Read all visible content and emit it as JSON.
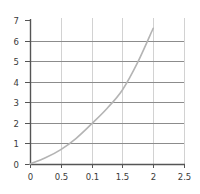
{
  "chart_data": {
    "type": "line",
    "title": "",
    "xlabel": "",
    "ylabel": "",
    "x_ticks": [
      "0",
      "0.5",
      "0.1",
      "1.5",
      "2",
      "2.5"
    ],
    "x_tick_values": [
      0,
      0.5,
      1,
      1.5,
      2,
      2.5
    ],
    "y_ticks": [
      "0",
      "1",
      "2",
      "3",
      "4",
      "5",
      "6",
      "7"
    ],
    "y_tick_values": [
      0,
      1,
      2,
      3,
      4,
      5,
      6,
      7
    ],
    "xlim": [
      0,
      2.5
    ],
    "ylim": [
      0,
      7
    ],
    "grid": true,
    "legend": null,
    "series": [
      {
        "name": "curve",
        "x": [
          0,
          0.25,
          0.5,
          0.75,
          1,
          1.25,
          1.5,
          1.75,
          2
        ],
        "y": [
          0,
          0.3,
          0.7,
          1.25,
          1.95,
          2.7,
          3.6,
          4.95,
          6.6
        ]
      }
    ]
  },
  "colors": {
    "axis": "#555555",
    "grid_horizontal": "#8c8c8c",
    "grid_vertical": "#d2d2d2",
    "curve": "#b4b4b4",
    "tick_label": "#3a3a3a"
  },
  "layout": {
    "origin_px": [
      30,
      164
    ],
    "x_px_per_unit": 61.6,
    "y_px_per_unit": 20.57
  }
}
